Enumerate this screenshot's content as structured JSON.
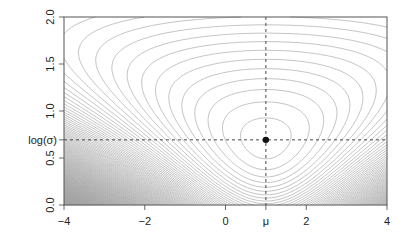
{
  "chart_data": {
    "type": "contour",
    "title": "",
    "xlabel": "",
    "ylabel": "",
    "xlim": [
      -4,
      4
    ],
    "ylim": [
      0,
      2
    ],
    "x_ticks": [
      {
        "value": -4,
        "label": "-4"
      },
      {
        "value": -2,
        "label": "-2"
      },
      {
        "value": 0,
        "label": "0"
      },
      {
        "value": 1,
        "label": "μ"
      },
      {
        "value": 2,
        "label": "2"
      },
      {
        "value": 4,
        "label": "4"
      }
    ],
    "y_ticks": [
      {
        "value": 0.0,
        "label": "0.0"
      },
      {
        "value": 0.5,
        "label": "0.5"
      },
      {
        "value": 0.693,
        "label": "log(σ)",
        "horizontal": true
      },
      {
        "value": 1.0,
        "label": "1.0"
      },
      {
        "value": 1.5,
        "label": "1.5"
      },
      {
        "value": 2.0,
        "label": "2.0"
      }
    ],
    "grid": false,
    "legend": null,
    "surface": "negative log-likelihood of normal model over (mu, log sigma)",
    "optimum": {
      "mu": 1.0,
      "log_sigma": 0.693
    },
    "sample_sd": 2.0,
    "contour_levels": {
      "start": 1.0,
      "step": 0.08,
      "count": 220
    },
    "reference_lines": [
      {
        "orientation": "vertical",
        "value": 1.0,
        "style": "dashed"
      },
      {
        "orientation": "horizontal",
        "value": 0.693,
        "style": "dashed"
      }
    ],
    "colors": {
      "contour": "#9a9a9a",
      "frame": "#555555",
      "point": "#111111",
      "dashed": "#333333"
    }
  }
}
